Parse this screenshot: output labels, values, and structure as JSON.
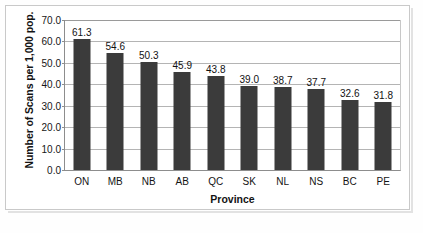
{
  "chart_data": {
    "type": "bar",
    "title": "",
    "subtitle": "",
    "xlabel": "Province",
    "ylabel": "Number of Scans per 1,000 pop.",
    "categories": [
      "ON",
      "MB",
      "NB",
      "AB",
      "QC",
      "SK",
      "NL",
      "NS",
      "BC",
      "PE"
    ],
    "values": [
      61.3,
      54.6,
      50.3,
      45.9,
      43.8,
      39.0,
      38.7,
      37.7,
      32.6,
      31.8
    ],
    "value_labels": [
      "61.3",
      "54.6",
      "50.3",
      "45.9",
      "43.8",
      "39.0",
      "38.7",
      "37.7",
      "32.6",
      "31.8"
    ],
    "ylim": [
      0,
      70
    ],
    "ytick_values": [
      70,
      60,
      50,
      40,
      30,
      20,
      10,
      0
    ],
    "ytick_labels": [
      "70.0",
      "60.0",
      "50.0",
      "40.0",
      "30.0",
      "20.0",
      "10.0",
      "0.0"
    ],
    "grid": true,
    "grid_axis": "y",
    "legend": false,
    "legend_position": "none",
    "bar_color": "#3b3b3b",
    "gridline_color": "#b4b4b4",
    "axis_color": "#8d8d8d",
    "plot_background": "#ffffff",
    "data_labels_shown": true,
    "series": [
      {
        "name": "Number of Scans per 1,000 pop.",
        "values": [
          61.3,
          54.6,
          50.3,
          45.9,
          43.8,
          39.0,
          38.7,
          37.7,
          32.6,
          31.8
        ]
      }
    ]
  }
}
